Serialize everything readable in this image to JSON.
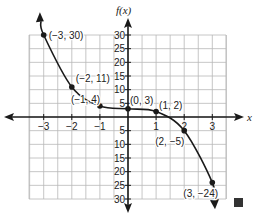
{
  "chart_data": {
    "type": "line",
    "title": "",
    "xlabel": "x",
    "ylabel": "f(x)",
    "xlim": [
      -3.5,
      3.5
    ],
    "ylim": [
      -30,
      30
    ],
    "grid": true,
    "x_ticks": [
      -3,
      -2,
      -1,
      1,
      2,
      3
    ],
    "y_ticks": [
      30,
      25,
      20,
      15,
      10,
      5,
      -5,
      -10,
      -15,
      -20,
      -25,
      -30
    ],
    "x_tick_labels": [
      "−3",
      "−2",
      "−1",
      "1",
      "2",
      "3"
    ],
    "y_tick_labels": [
      "30",
      "25",
      "20",
      "15",
      "10",
      "5",
      "5",
      "10",
      "15",
      "20",
      "25",
      "30"
    ],
    "series": [
      {
        "name": "f(x)",
        "x": [
          -3,
          -2,
          -1,
          0,
          1,
          2,
          3
        ],
        "y": [
          30,
          11,
          4,
          3,
          2,
          -5,
          -24
        ],
        "point_labels": [
          "(−3, 30)",
          "(−2, 11)",
          "(−1, 4)",
          "(0, 3)",
          "(1, 2)",
          "(2, −5)",
          "(3, −24)"
        ],
        "end_arrows": true
      }
    ],
    "annotations": [
      "end-of-proof square"
    ]
  },
  "colors": {
    "grid": "#b8b8b8",
    "axis": "#1a1a1a",
    "curve": "#1a1a1a",
    "end_square": "#333333"
  }
}
